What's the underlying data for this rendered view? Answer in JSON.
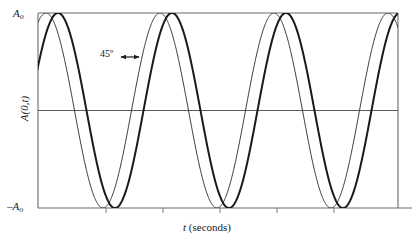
{
  "figure": {
    "title": "",
    "axis_labels": {
      "y_top": "A",
      "y_top_sub": "o",
      "y_bottom_prefix": "–A",
      "y_bottom_sub": "o",
      "y_axis": "A(0,t)",
      "x_axis_italic": "t",
      "x_axis_rest": " (seconds)"
    },
    "annotation": {
      "phase_label": "45º",
      "arrow": "double-headed-arrow"
    },
    "colors": {
      "axis": "#4d4d4d",
      "curve_thin": "#3a3a3a",
      "curve_bold": "#1a1a1a",
      "background": "#ffffff"
    }
  },
  "chart_data": {
    "type": "line",
    "title": "",
    "xlabel": "t (seconds)",
    "ylabel": "A(0,t)",
    "ylim": [
      -1,
      1
    ],
    "xlim": [
      0,
      3.158
    ],
    "ytick_labels": [
      "A_o",
      "0",
      "-A_o"
    ],
    "ytick_values": [
      1,
      0,
      -1
    ],
    "xtick_values": [
      0.6,
      1.1,
      1.6,
      2.1,
      2.6
    ],
    "xtick_labels": [
      "",
      "",
      "",
      "",
      ""
    ],
    "grid": false,
    "legend": null,
    "annotations": [
      {
        "text": "45º",
        "meaning": "phase difference between the two waveforms",
        "x_px": 118,
        "y_px": 57
      }
    ],
    "series": [
      {
        "name": "reference wave",
        "style": "thin",
        "color": "#3a3a3a",
        "linewidth": 1,
        "form": "A_o * cos(2*pi*t / T)",
        "amplitude": 1,
        "period_px": 114,
        "period_units": 1.0,
        "phase_deg": 0,
        "first_peak_px": 46
      },
      {
        "name": "delayed wave",
        "style": "bold",
        "color": "#1a1a1a",
        "linewidth": 2,
        "form": "A_o * cos(2*pi*t / T - 45deg)",
        "amplitude": 1,
        "period_px": 114,
        "period_units": 1.0,
        "phase_deg": -45,
        "first_peak_px": 58
      }
    ]
  }
}
